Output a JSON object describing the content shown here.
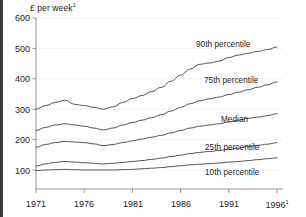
{
  "figure": {
    "unit_title": "£ per week",
    "unit_title_marker": "1",
    "background_color": "#ffffff",
    "line_color": "#4a4a4a",
    "grid_color": "#cfcfcf",
    "axis_color": "#8a8a8a",
    "text_color": "#1d1d1d"
  },
  "chart_data": {
    "type": "line",
    "title": "£ per week",
    "xlabel": "",
    "ylabel": "£ per week",
    "xlim": [
      1971,
      1996
    ],
    "ylim": [
      0,
      600
    ],
    "yticks": [
      100,
      200,
      300,
      400,
      500,
      600
    ],
    "xticks": [
      1971,
      1976,
      1981,
      1986,
      1991,
      1996
    ],
    "xtick_labels": [
      "1971",
      "1976",
      "1981",
      "1986",
      "1991",
      "1996"
    ],
    "grid": true,
    "grid_style": "dotted-horizontal",
    "legend_position": "inline-right-of-lines",
    "x": [
      1971,
      1972,
      1973,
      1974,
      1975,
      1976,
      1977,
      1978,
      1979,
      1980,
      1981,
      1982,
      1983,
      1984,
      1985,
      1986,
      1987,
      1988,
      1989,
      1990,
      1991,
      1992,
      1993,
      1994,
      1995,
      1996
    ],
    "series": [
      {
        "name": "90th percentile",
        "label": "90th percentile",
        "values": [
          300,
          312,
          322,
          330,
          316,
          312,
          306,
          300,
          308,
          322,
          335,
          345,
          358,
          372,
          392,
          412,
          432,
          448,
          452,
          458,
          470,
          478,
          484,
          490,
          496,
          505
        ]
      },
      {
        "name": "75th percentile",
        "label": "75th percentile",
        "values": [
          230,
          240,
          248,
          252,
          248,
          244,
          238,
          232,
          238,
          248,
          256,
          264,
          272,
          282,
          294,
          306,
          318,
          328,
          334,
          340,
          348,
          356,
          364,
          372,
          380,
          390
        ]
      },
      {
        "name": "Median",
        "label": "Median",
        "values": [
          175,
          184,
          190,
          194,
          192,
          190,
          186,
          180,
          184,
          190,
          196,
          202,
          208,
          214,
          222,
          230,
          238,
          244,
          248,
          252,
          258,
          264,
          270,
          274,
          279,
          285
        ]
      },
      {
        "name": "25th percentile",
        "label": "25th percentile",
        "values": [
          113,
          120,
          125,
          128,
          126,
          124,
          122,
          120,
          122,
          125,
          128,
          131,
          135,
          139,
          144,
          149,
          154,
          158,
          161,
          164,
          168,
          172,
          177,
          181,
          185,
          190
        ]
      },
      {
        "name": "10th percentile",
        "label": "10th percentile",
        "values": [
          98,
          100,
          101,
          102,
          101,
          100,
          100,
          100,
          100,
          101,
          102,
          104,
          106,
          108,
          111,
          114,
          117,
          119,
          121,
          123,
          126,
          128,
          131,
          134,
          137,
          140
        ]
      }
    ]
  },
  "axis_labels": {
    "y": [
      "600",
      "500",
      "400",
      "300",
      "200",
      "100"
    ],
    "x": [
      "1971",
      "1976",
      "1981",
      "1986",
      "1991",
      "1996"
    ],
    "x_last_marker": "1"
  },
  "series_labels": {
    "p90": "90th percentile",
    "p75": "75th percentile",
    "median": "Median",
    "p25": "25th percentile",
    "p10": "10th percentile"
  }
}
